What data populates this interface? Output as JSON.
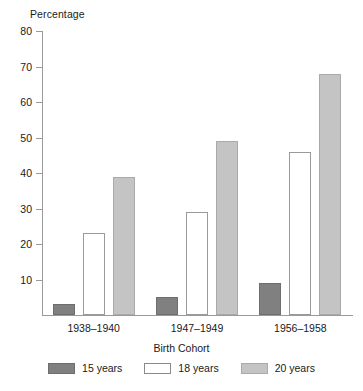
{
  "chart_data": {
    "type": "bar",
    "title": "",
    "xlabel": "Birth Cohort",
    "ylabel": "Percentage",
    "categories": [
      "1938–1940",
      "1947–1949",
      "1956–1958"
    ],
    "series": [
      {
        "name": "15 years",
        "values": [
          3,
          5,
          9
        ],
        "color": "#808080"
      },
      {
        "name": "18 years",
        "values": [
          23,
          29,
          46
        ],
        "color": "#ffffff"
      },
      {
        "name": "20 years",
        "values": [
          39,
          49,
          68
        ],
        "color": "#c4c4c4"
      }
    ],
    "ylim": [
      0,
      80
    ],
    "yticks": [
      10,
      20,
      30,
      40,
      50,
      60,
      70,
      80
    ],
    "ytick_labels": [
      "10",
      "20",
      "30",
      "40",
      "50",
      "60",
      "70",
      "80"
    ],
    "grid": false,
    "legend_position": "bottom"
  },
  "axes": {
    "y_title": "Percentage",
    "x_title": "Birth Cohort"
  }
}
